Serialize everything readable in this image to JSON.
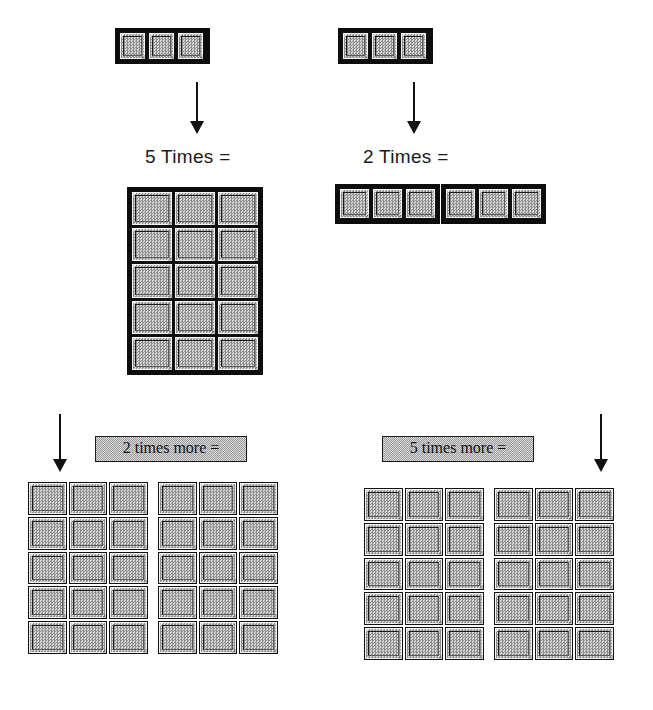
{
  "figure": {
    "block_fill_color": "#b9b9b9",
    "block_outline_color": "#111111",
    "label_box_color": "#c8c8c8",
    "arrow_color": "#111111",
    "background_color": "#ffffff"
  },
  "top_row": {
    "left_unit": {
      "name": "three-block-rod",
      "blocks": 3,
      "rows": 1,
      "cols": 3
    },
    "right_unit": {
      "name": "three-block-rod",
      "blocks": 3,
      "rows": 1,
      "cols": 3
    }
  },
  "arrows": {
    "top_left": {
      "name": "down-arrow",
      "direction": "down"
    },
    "top_right": {
      "name": "down-arrow",
      "direction": "down"
    },
    "bottom_left": {
      "name": "down-arrow",
      "direction": "down"
    },
    "bottom_right": {
      "name": "down-arrow",
      "direction": "down"
    }
  },
  "stage_two": {
    "left_label": "5 Times =",
    "right_label": "2 Times =",
    "left_result": {
      "name": "five-by-three-slab",
      "rows": 5,
      "cols": 3,
      "blocks": 15
    },
    "right_result": {
      "name": "six-block-rod",
      "rows": 1,
      "cols": 6,
      "blocks": 6,
      "groups": 2
    }
  },
  "stage_three": {
    "left_label": "2 times more =",
    "right_label": "5 times more =",
    "left_result": {
      "name": "thirty-block-array",
      "groups": 2,
      "rows": 5,
      "cols": 3,
      "blocks": 30
    },
    "right_result": {
      "name": "thirty-block-array",
      "groups": 2,
      "rows": 5,
      "cols": 3,
      "blocks": 30
    }
  }
}
